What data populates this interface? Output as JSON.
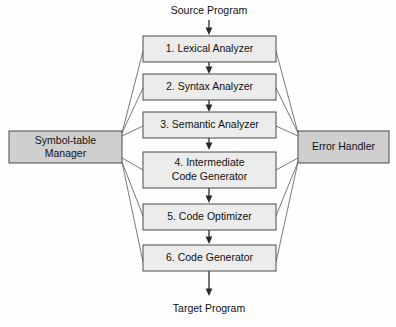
{
  "diagram": {
    "background_color": "#fefefe",
    "phase_box_fill": "#ececec",
    "side_box_fill": "#cfcfcf",
    "box_border_color": "#4a4a4a",
    "arrow_color": "#2b2b2b",
    "connector_color": "#6a6a6a",
    "input_label": "Source Program",
    "output_label": "Target Program",
    "phases": [
      {
        "id": "lexical-analyzer",
        "number": "1.",
        "line1": "1. Lexical Analyzer",
        "line2": ""
      },
      {
        "id": "syntax-analyzer",
        "number": "2.",
        "line1": "2. Syntax Analyzer",
        "line2": ""
      },
      {
        "id": "semantic-analyzer",
        "number": "3.",
        "line1": "3. Semantic Analyzer",
        "line2": ""
      },
      {
        "id": "intermediate-code-generator",
        "number": "4.",
        "line1": "4. Intermediate",
        "line2": "Code Generator"
      },
      {
        "id": "code-optimizer",
        "number": "5.",
        "line1": "5. Code Optimizer",
        "line2": ""
      },
      {
        "id": "code-generator",
        "number": "6.",
        "line1": "6. Code Generator",
        "line2": ""
      }
    ],
    "side_boxes": [
      {
        "id": "symbol-table-manager",
        "line1": "Symbol-table",
        "line2": "Manager",
        "side": "left"
      },
      {
        "id": "error-handler",
        "line1": "Error Handler",
        "line2": "",
        "side": "right"
      }
    ]
  }
}
